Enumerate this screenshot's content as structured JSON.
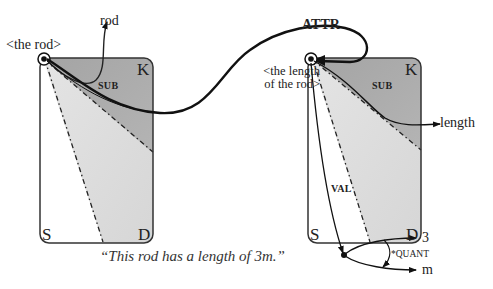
{
  "left_frame": {
    "node_label": "<the rod>",
    "arrow_target": "rod",
    "region_label": "SUB",
    "corners": {
      "top_right": "K",
      "bottom_left": "S",
      "bottom_right": "D"
    }
  },
  "right_frame": {
    "node_label_line1": "<the length",
    "node_label_line2": "of the rod>",
    "region_label": "SUB",
    "arrow_target": "length",
    "val_label": "VAL",
    "corners": {
      "top_right": "K",
      "bottom_left": "S",
      "bottom_right": "D"
    }
  },
  "relation": {
    "label": "ATTR"
  },
  "quantity": {
    "label": "*QUANT",
    "value": "3",
    "unit": "m"
  },
  "caption": "“This rod has a length of 3m.”",
  "colors": {
    "outline": "#333333",
    "dark_region": "#a9a9a9",
    "light_region": "#d9d9d9",
    "curve": "#111111"
  }
}
